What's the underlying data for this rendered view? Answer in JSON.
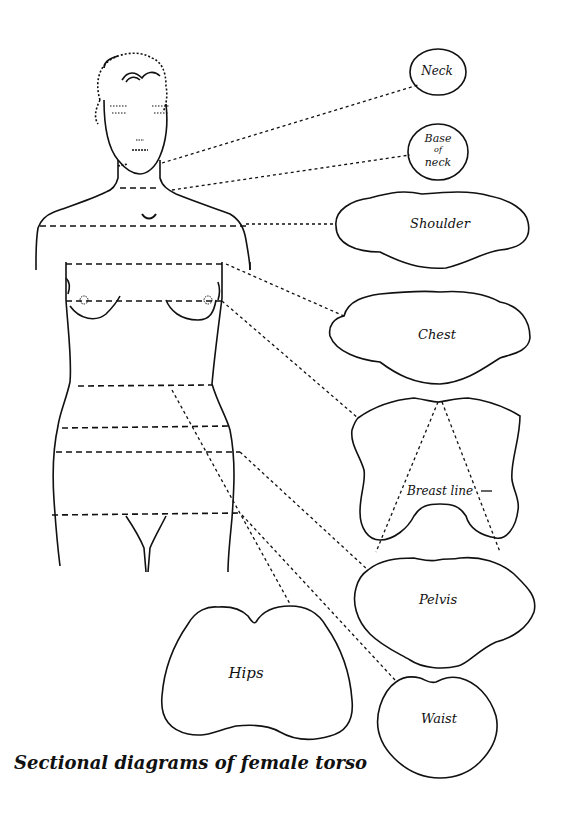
{
  "figure": {
    "caption": "Sectional diagrams of female torso",
    "line_color": "#111111",
    "background": "#ffffff"
  },
  "sections": {
    "neck": {
      "label": "Neck"
    },
    "base_of_neck": {
      "label_line1": "Base",
      "label_line2": "of",
      "label_line3": "neck"
    },
    "shoulder": {
      "label": "Shoulder"
    },
    "chest": {
      "label": "Chest"
    },
    "breast": {
      "label": "Breast line"
    },
    "pelvis": {
      "label": "Pelvis"
    },
    "hips": {
      "label": "Hips"
    },
    "waist": {
      "label": "Waist"
    }
  }
}
